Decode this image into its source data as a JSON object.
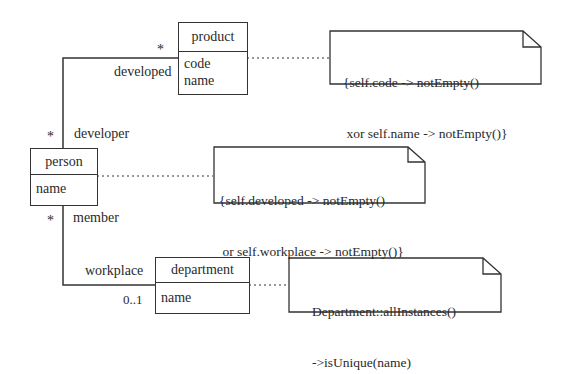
{
  "diagram": {
    "type": "UML class diagram with OCL constraints",
    "classes": [
      {
        "name": "product",
        "attributes": [
          "code",
          "name"
        ]
      },
      {
        "name": "person",
        "attributes": [
          "name"
        ]
      },
      {
        "name": "department",
        "attributes": [
          "name"
        ]
      }
    ],
    "associations": [
      {
        "ends": [
          {
            "class": "person",
            "role": "developer",
            "multiplicity": "*"
          },
          {
            "class": "product",
            "role": "developed",
            "multiplicity": "*"
          }
        ]
      },
      {
        "ends": [
          {
            "class": "person",
            "role": "member",
            "multiplicity": "*"
          },
          {
            "class": "department",
            "role": "workplace",
            "multiplicity": "0..1"
          }
        ]
      }
    ],
    "notes": [
      {
        "attached_to": "product",
        "lines": [
          "{self.code -> notEmpty()",
          " xor self.name -> notEmpty()}"
        ]
      },
      {
        "attached_to": "person",
        "lines": [
          "{self.developed -> notEmpty()",
          " or self.workplace -> notEmpty()}"
        ]
      },
      {
        "attached_to": "department",
        "lines": [
          "Department::allInstances()",
          "->isUnique(name)"
        ]
      }
    ]
  },
  "labels": {
    "product_title": "product",
    "product_attr_code": "code",
    "product_attr_name": "name",
    "person_title": "person",
    "person_attr_name": "name",
    "department_title": "department",
    "department_attr_name": "name",
    "role_developed": "developed",
    "mult_developed": "*",
    "role_developer": "developer",
    "mult_developer": "*",
    "role_member": "member",
    "mult_member": "*",
    "role_workplace": "workplace",
    "mult_workplace": "0..1",
    "note1_line1": "{self.code -> notEmpty()",
    "note1_line2": " xor self.name -> notEmpty()}",
    "note2_line1": "{self.developed -> notEmpty()",
    "note2_line2": " or self.workplace -> notEmpty()}",
    "note3_line1": "Department::allInstances()",
    "note3_line2": "->isUnique(name)"
  }
}
